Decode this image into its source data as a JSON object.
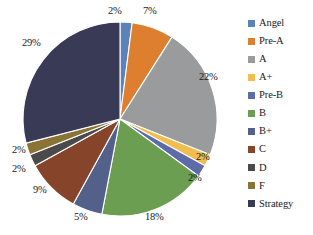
{
  "chart_data": {
    "type": "pie",
    "title": "",
    "categories": [
      "Angel",
      "Pre-A",
      "A",
      "A+",
      "Pre-B",
      "B",
      "B+",
      "C",
      "D",
      "F",
      "Strategy"
    ],
    "values": [
      2,
      7,
      22,
      2,
      2,
      18,
      5,
      9,
      2,
      2,
      29
    ],
    "value_labels": [
      "2%",
      "7%",
      "22%",
      "2%",
      "2%",
      "18%",
      "5%",
      "9%",
      "2%",
      "2%",
      "29%"
    ],
    "colors": [
      "#5b83ba",
      "#dd7f2e",
      "#9a9b9c",
      "#f0bd4e",
      "#5d6ba8",
      "#6b9e50",
      "#53618a",
      "#86452a",
      "#4a4a4a",
      "#8a7435",
      "#393a56"
    ],
    "unit": "%",
    "start_angle_deg": 0,
    "direction": "clockwise",
    "legend_position": "right",
    "grid": false,
    "xlabel": "",
    "ylabel": ""
  },
  "legend": {
    "items": [
      {
        "label": "Angel",
        "color": "#5b83ba"
      },
      {
        "label": "Pre-A",
        "color": "#dd7f2e"
      },
      {
        "label": "A",
        "color": "#9a9b9c"
      },
      {
        "label": "A+",
        "color": "#f0bd4e"
      },
      {
        "label": "Pre-B",
        "color": "#5d6ba8"
      },
      {
        "label": "B",
        "color": "#6b9e50"
      },
      {
        "label": "B+",
        "color": "#53618a"
      },
      {
        "label": "C",
        "color": "#86452a"
      },
      {
        "label": "D",
        "color": "#4a4a4a"
      },
      {
        "label": "F",
        "color": "#8a7435"
      },
      {
        "label": "Strategy",
        "color": "#393a56"
      }
    ]
  },
  "labels": [
    {
      "text": "2%",
      "x": 108,
      "y": 6,
      "slice": "Angel"
    },
    {
      "text": "7%",
      "x": 143,
      "y": 6,
      "slice": "Pre-A"
    },
    {
      "text": "22%",
      "x": 199,
      "y": 72,
      "slice": "A"
    },
    {
      "text": "2%",
      "x": 196,
      "y": 152,
      "slice": "A+"
    },
    {
      "text": "2%",
      "x": 188,
      "y": 173,
      "slice": "Pre-B"
    },
    {
      "text": "18%",
      "x": 145,
      "y": 212,
      "slice": "B"
    },
    {
      "text": "5%",
      "x": 74,
      "y": 212,
      "slice": "B+"
    },
    {
      "text": "9%",
      "x": 33,
      "y": 185,
      "slice": "C"
    },
    {
      "text": "2%",
      "x": 12,
      "y": 164,
      "slice": "D"
    },
    {
      "text": "2%",
      "x": 12,
      "y": 145,
      "slice": "F"
    },
    {
      "text": "29%",
      "x": 22,
      "y": 38,
      "slice": "Strategy"
    }
  ],
  "geometry": {
    "cx": 120,
    "cy": 119,
    "r": 97
  }
}
